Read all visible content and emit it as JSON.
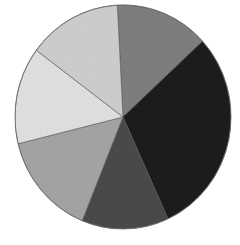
{
  "chart_data": {
    "type": "pie",
    "title": "",
    "legend": [],
    "start_angle_deg": -3,
    "direction": "clockwise",
    "categories": [
      "",
      "",
      "",
      "",
      "",
      ""
    ],
    "values": [
      14,
      30,
      13,
      15,
      14,
      14
    ],
    "colors": [
      "#7f7f7f",
      "#1e1e1e",
      "#4a4a4a",
      "#a5a5a5",
      "#e2e2e2",
      "#cfcfcf"
    ],
    "slice_positions": [
      "top-right",
      "right",
      "bottom",
      "lower-left",
      "left",
      "top-left"
    ],
    "labels_shown": false,
    "legend_shown": false
  },
  "geometry": {
    "cx": 123,
    "cy": 117,
    "rx": 108,
    "ry": 112
  }
}
